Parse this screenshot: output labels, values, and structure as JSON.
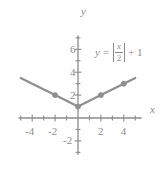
{
  "figure": {
    "kind": "math-graph",
    "background": "#ffffff",
    "ink_color": "#8c8c8c",
    "curve_color": "#8f8f8f"
  },
  "equation": {
    "lhs": "y",
    "equals": "=",
    "numerator": "x",
    "denominator": "2",
    "tail": "+ 1",
    "plain": "y = |x/2| + 1"
  },
  "axis_labels": {
    "x": "x",
    "y": "y"
  },
  "x_tick_labels": [
    "-4",
    "-2",
    "2",
    "4"
  ],
  "y_tick_labels": [
    "6",
    "4",
    "2",
    "-2"
  ],
  "chart_data": {
    "type": "line",
    "title": "",
    "subtitle": "",
    "xlabel": "x",
    "ylabel": "y",
    "xlim": [
      -5.2,
      5.2
    ],
    "ylim": [
      -3.2,
      7.2
    ],
    "grid": false,
    "legend": null,
    "legend_position": "none",
    "x_ticks_major": [
      -4,
      -2,
      2,
      4
    ],
    "x_ticks_minor": [
      -5,
      -3,
      -1,
      1,
      3,
      5
    ],
    "y_ticks_major": [
      6,
      4,
      2,
      -2
    ],
    "y_ticks_minor": [
      7,
      5,
      3,
      1,
      -1,
      -3
    ],
    "series": [
      {
        "name": "y = |x/2| + 1",
        "equation": "y = abs(x/2) + 1",
        "x": [
          -5.0,
          -4,
          -2,
          0,
          2,
          4,
          5.0
        ],
        "values": [
          3.5,
          3,
          2,
          1,
          2,
          3,
          3.5
        ],
        "color": "#8f8f8f",
        "linewidth": 2.2
      }
    ],
    "markers": [
      {
        "x": -2,
        "y": 2
      },
      {
        "x": 0,
        "y": 1
      },
      {
        "x": 2,
        "y": 2
      },
      {
        "x": 4,
        "y": 3
      }
    ],
    "annotations": [
      {
        "text": "y = |x/2| + 1",
        "x": 1.6,
        "y": 4.2
      }
    ]
  }
}
